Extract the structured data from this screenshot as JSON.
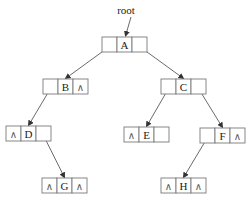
{
  "diagram": {
    "type": "binary-linked-list-tree",
    "root_label": "root",
    "null_symbol": "∧",
    "nodes": [
      {
        "id": "A",
        "label": "A",
        "x": 102,
        "y": 37,
        "left": "ptr",
        "right": "ptr"
      },
      {
        "id": "B",
        "label": "B",
        "x": 43,
        "y": 79,
        "left": "ptr",
        "right": "null"
      },
      {
        "id": "C",
        "label": "C",
        "x": 161,
        "y": 79,
        "left": "ptr",
        "right": "ptr"
      },
      {
        "id": "D",
        "label": "D",
        "x": 6,
        "y": 126,
        "left": "null",
        "right": "ptr"
      },
      {
        "id": "E",
        "label": "E",
        "x": 124,
        "y": 127,
        "left": "null",
        "right": "empty"
      },
      {
        "id": "F",
        "label": "F",
        "x": 200,
        "y": 128,
        "left": "ptr",
        "right": "null"
      },
      {
        "id": "G",
        "label": "G",
        "x": 42,
        "y": 178,
        "left": "null",
        "right": "null"
      },
      {
        "id": "H",
        "label": "H",
        "x": 161,
        "y": 178,
        "left": "null",
        "right": "null"
      }
    ],
    "edges": [
      {
        "from": "A",
        "side": "left",
        "to": "B"
      },
      {
        "from": "A",
        "side": "right",
        "to": "C"
      },
      {
        "from": "B",
        "side": "left",
        "to": "D"
      },
      {
        "from": "C",
        "side": "left",
        "to": "E"
      },
      {
        "from": "C",
        "side": "right",
        "to": "F"
      },
      {
        "from": "D",
        "side": "right",
        "to": "G"
      },
      {
        "from": "F",
        "side": "left",
        "to": "H"
      }
    ],
    "colors": {
      "line": "#444444",
      "box": "#7a7a7a",
      "text": "#222222",
      "background": "#ffffff"
    }
  }
}
